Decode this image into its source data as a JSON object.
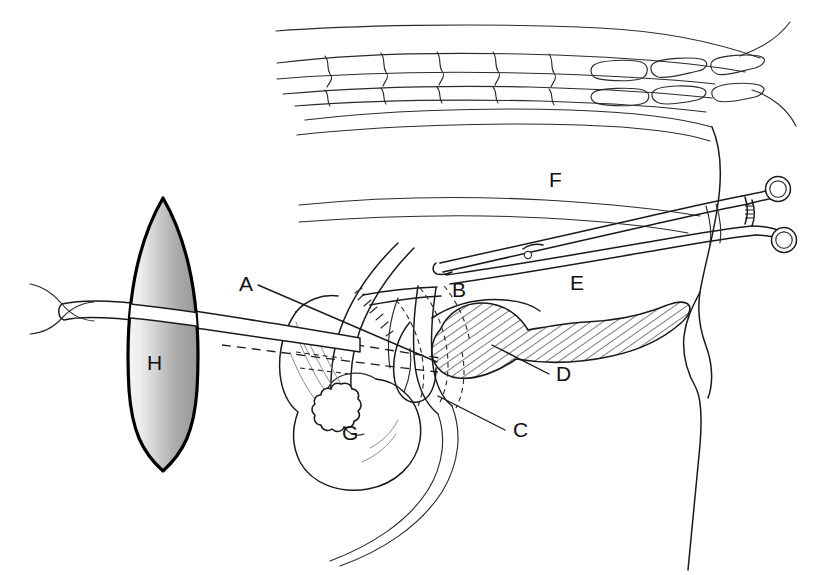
{
  "figure": {
    "background_color": "#ffffff",
    "ink_color": "#1a1a1a",
    "width": 821,
    "height": 575
  },
  "labels": [
    {
      "key": "A",
      "text": "A",
      "x": 239,
      "y": 291,
      "leader": true,
      "leader_from": [
        258,
        285
      ],
      "leader_to": [
        437,
        362
      ]
    },
    {
      "key": "B",
      "text": "B",
      "x": 452,
      "y": 297,
      "leader": false,
      "leader_from": [
        0,
        0
      ],
      "leader_to": [
        0,
        0
      ]
    },
    {
      "key": "C",
      "text": "C",
      "x": 513,
      "y": 437,
      "leader": true,
      "leader_from": [
        505,
        430
      ],
      "leader_to": [
        438,
        396
      ]
    },
    {
      "key": "D",
      "text": "D",
      "x": 556,
      "y": 381,
      "leader": true,
      "leader_from": [
        549,
        374
      ],
      "leader_to": [
        492,
        345
      ]
    },
    {
      "key": "E",
      "text": "E",
      "x": 570,
      "y": 290,
      "leader": false,
      "leader_from": [
        0,
        0
      ],
      "leader_to": [
        0,
        0
      ]
    },
    {
      "key": "F",
      "text": "F",
      "x": 549,
      "y": 187,
      "leader": false,
      "leader_from": [
        0,
        0
      ],
      "leader_to": [
        0,
        0
      ]
    },
    {
      "key": "G",
      "text": "G",
      "x": 342,
      "y": 440,
      "leader": false,
      "leader_from": [
        0,
        0
      ],
      "leader_to": [
        0,
        0
      ]
    },
    {
      "key": "H",
      "text": "H",
      "x": 147,
      "y": 370,
      "leader": false,
      "leader_from": [
        0,
        0
      ],
      "leader_to": [
        0,
        0
      ]
    }
  ],
  "elements": {
    "lens": {
      "name": "gradient-lens-shape",
      "label": "H",
      "fill_light": "#f2f2f2",
      "fill_dark": "#9c9c9c",
      "outline_color": "#000000"
    },
    "hatched_organ": {
      "name": "hatched-pancreas",
      "label": "D",
      "hatch_color": "#1a1a1a",
      "fill": "#ffffff"
    },
    "forceps": {
      "name": "surgical-forceps",
      "ring_count": 2,
      "has_ratchet_lock": true
    },
    "vertebrae": {
      "name": "vertebral-column",
      "body_count": 5,
      "small_segment_count": 6
    },
    "gallbladder": {
      "name": "gallbladder",
      "label": "G",
      "has_stone": true
    },
    "tube": {
      "name": "cannula-tube",
      "has_suture_cross": true
    }
  }
}
